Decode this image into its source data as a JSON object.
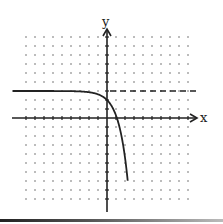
{
  "figure": {
    "x_axis_label": "x",
    "y_axis_label": "y",
    "grid": {
      "type": "dots",
      "x_range": [
        -9,
        9
      ],
      "y_range": [
        -9,
        9
      ],
      "spacing_px": 9
    },
    "origin_px": [
      107,
      118
    ],
    "asymptote": {
      "type": "horizontal",
      "y": 3,
      "style": "dashed"
    },
    "curve": {
      "description": "y = 3 - e^x",
      "y_intercept": 2,
      "x_intercept": 1.1
    },
    "colors": {
      "ink": "#222222",
      "grid_dot": "#666666",
      "background": "#ffffff"
    }
  }
}
